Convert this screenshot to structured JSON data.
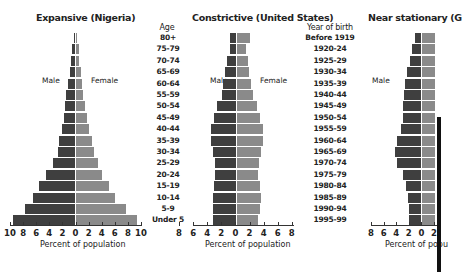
{
  "chart_data": [
    {
      "type": "bar",
      "orientation": "horizontal-population-pyramid",
      "title": "Expansive (Nigeria)",
      "xlabel": "Percent of population",
      "xlim": [
        -10,
        10
      ],
      "xticks": [
        "10",
        "8",
        "6",
        "4",
        "2",
        "0",
        "2",
        "4",
        "6",
        "8",
        "10"
      ],
      "side_labels": {
        "left": "Male",
        "right": "Female"
      },
      "categories_top_to_bottom": [
        "80+",
        "75-79",
        "70-74",
        "65-69",
        "60-64",
        "55-59",
        "50-54",
        "45-49",
        "40-44",
        "35-39",
        "30-34",
        "25-29",
        "20-24",
        "15-19",
        "10-14",
        "5-9",
        "Under 5"
      ],
      "series": [
        {
          "name": "Male",
          "values": [
            0.2,
            0.4,
            0.6,
            0.8,
            1.0,
            1.3,
            1.6,
            1.7,
            2.0,
            2.4,
            2.6,
            3.4,
            4.5,
            5.5,
            6.4,
            7.6,
            9.4
          ]
        },
        {
          "name": "Female",
          "values": [
            0.2,
            0.4,
            0.5,
            0.7,
            0.9,
            1.1,
            1.4,
            1.7,
            2.0,
            2.4,
            2.7,
            3.3,
            4.0,
            5.0,
            6.0,
            7.6,
            9.3
          ]
        }
      ]
    },
    {
      "type": "bar",
      "orientation": "horizontal-population-pyramid",
      "title": "Constrictive (United States)",
      "xlabel": "Percent of population",
      "xlim": [
        -8,
        8
      ],
      "xticks": [
        "8",
        "6",
        "4",
        "2",
        "0",
        "2",
        "4",
        "6",
        "8"
      ],
      "side_labels": {
        "left": "Male",
        "right": "Female"
      },
      "categories_top_to_bottom": [
        "80+",
        "75-79",
        "70-74",
        "65-69",
        "60-64",
        "55-59",
        "50-54",
        "45-49",
        "40-44",
        "35-39",
        "30-34",
        "25-29",
        "20-24",
        "15-19",
        "10-14",
        "5-9",
        "Under 5"
      ],
      "series": [
        {
          "name": "Male",
          "values": [
            1.0,
            1.0,
            1.4,
            1.8,
            2.0,
            2.2,
            3.0,
            3.5,
            4.0,
            4.0,
            3.7,
            3.4,
            3.4,
            3.5,
            3.6,
            3.6,
            3.6
          ]
        },
        {
          "name": "Female",
          "values": [
            2.1,
            1.5,
            1.8,
            1.9,
            2.2,
            2.5,
            3.2,
            3.7,
            4.1,
            4.1,
            3.8,
            3.5,
            3.4,
            3.6,
            3.8,
            3.6,
            3.4
          ]
        }
      ]
    },
    {
      "type": "bar",
      "orientation": "horizontal-population-pyramid",
      "title": "Near stationary (G",
      "xlabel": "Percent of popu",
      "xlim": [
        -8,
        2
      ],
      "xticks": [
        "8",
        "6",
        "4",
        "2",
        "0",
        "2"
      ],
      "side_labels": {
        "left": "Male"
      },
      "categories_top_to_bottom": [
        "Before 1919",
        "1920-24",
        "1925-29",
        "1930-34",
        "1935-39",
        "1940-44",
        "1945-49",
        "1950-54",
        "1955-59",
        "1960-64",
        "1965-69",
        "1970-74",
        "1975-79",
        "1980-84",
        "1985-89",
        "1990-94",
        "1995-99"
      ],
      "series": [
        {
          "name": "Male",
          "values": [
            1.0,
            1.4,
            1.8,
            2.2,
            2.6,
            2.7,
            2.9,
            2.8,
            3.2,
            3.8,
            4.1,
            3.8,
            2.9,
            2.4,
            2.0,
            1.9,
            1.9
          ]
        },
        {
          "name": "Female",
          "values": [
            2.0,
            2.0,
            2.0,
            2.0,
            2.0,
            2.0,
            2.0,
            2.0,
            2.0,
            2.0,
            2.0,
            2.0,
            2.0,
            2.0,
            2.0,
            2.0,
            2.0
          ]
        }
      ]
    }
  ],
  "labels": {
    "age_header": "Age",
    "ages": [
      "80+",
      "75-79",
      "70-74",
      "65-69",
      "60-64",
      "55-59",
      "50-54",
      "45-49",
      "40-44",
      "35-39",
      "30-34",
      "25-29",
      "20-24",
      "15-19",
      "10-14",
      "5-9",
      "Under 5"
    ],
    "year_header": "Year of birth",
    "years": [
      "Before 1919",
      "1920-24",
      "1925-29",
      "1930-34",
      "1935-39",
      "1940-44",
      "1945-49",
      "1950-54",
      "1955-59",
      "1960-64",
      "1965-69",
      "1970-74",
      "1975-79",
      "1980-84",
      "1985-89",
      "1990-94",
      "1995-99"
    ]
  },
  "charts": {
    "nigeria": {
      "title": "Expansive (Nigeria)",
      "male": "Male",
      "female": "Female",
      "xlabel": "Percent of population",
      "ticks": [
        "10",
        "8",
        "6",
        "4",
        "2",
        "0",
        "2",
        "4",
        "6",
        "8",
        "10"
      ]
    },
    "us": {
      "title": "Constrictive (United States)",
      "male": "Male",
      "female": "Female",
      "xlabel": "Percent of population",
      "ticks": [
        "8",
        "6",
        "4",
        "2",
        "0",
        "2",
        "4",
        "6",
        "8"
      ]
    },
    "germany": {
      "title": "Near stationary (G",
      "male": "Male",
      "xlabel": "Percent of popu",
      "ticks": [
        "8",
        "6",
        "4",
        "2",
        "0",
        "2"
      ]
    }
  },
  "colors": {
    "male": "#3f3f3f",
    "female": "#8a8a8a",
    "axis": "#333333"
  }
}
